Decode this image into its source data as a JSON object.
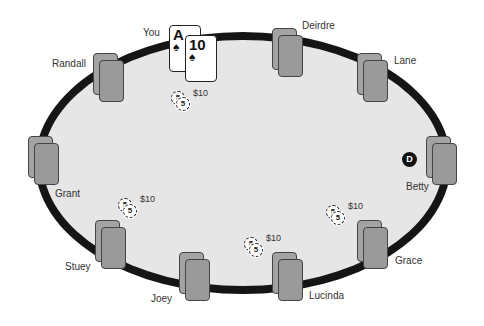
{
  "table": {
    "felt_color": "#e6e6e6",
    "rail_color": "#151515",
    "dealer_button": {
      "label": "D",
      "seat": "Betty"
    }
  },
  "hero": {
    "name": "You",
    "cards": [
      {
        "rank": "A",
        "suit": "♠"
      },
      {
        "rank": "10",
        "suit": "♠"
      }
    ],
    "bet": {
      "amount": "$10",
      "chips": [
        "5",
        "5"
      ]
    }
  },
  "players": [
    {
      "name": "Deirdre"
    },
    {
      "name": "Lane"
    },
    {
      "name": "Betty"
    },
    {
      "name": "Grace"
    },
    {
      "name": "Lucinda"
    },
    {
      "name": "Joey"
    },
    {
      "name": "Stuey"
    },
    {
      "name": "Grant"
    },
    {
      "name": "Randall"
    }
  ],
  "bets": [
    {
      "player": "Grant",
      "amount": "$10",
      "chips": [
        "5",
        "5"
      ]
    },
    {
      "player": "Joey",
      "amount": "$10",
      "chips": [
        "5",
        "5"
      ]
    },
    {
      "player": "Grace",
      "amount": "$10",
      "chips": [
        "5",
        "5"
      ]
    }
  ]
}
